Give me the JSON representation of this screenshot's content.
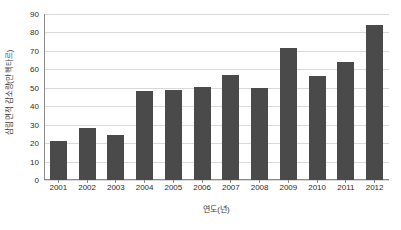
{
  "chart_data": {
    "type": "bar",
    "title": "",
    "subtitle": "",
    "xlabel": "연도(년)",
    "ylabel": "삼림 면적 감소량(만 헥타르)",
    "categories": [
      "2001",
      "2002",
      "2003",
      "2004",
      "2005",
      "2006",
      "2007",
      "2008",
      "2009",
      "2010",
      "2011",
      "2012"
    ],
    "values": [
      21,
      28,
      24.5,
      48,
      49,
      50.5,
      57,
      50,
      71.5,
      56.5,
      64,
      84
    ],
    "series": [
      {
        "name": "삼림 면적 감소량",
        "values": [
          21,
          28,
          24.5,
          48,
          49,
          50.5,
          57,
          50,
          71.5,
          56.5,
          64,
          84
        ]
      }
    ],
    "ylim": [
      0,
      90
    ],
    "yticks": [
      0,
      10,
      20,
      30,
      40,
      50,
      60,
      70,
      80,
      90
    ],
    "ytick_labels": [
      "0",
      "10",
      "20",
      "30",
      "40",
      "50",
      "60",
      "70",
      "80",
      "90"
    ],
    "grid": true,
    "grid_axis": "y",
    "legend": false,
    "legend_position": "none",
    "bar_color": "#4a4a4a",
    "grid_color": "#d9d9d9",
    "axis_color": "#8a8a8a",
    "background_color": "#ffffff",
    "text_color": "#2b2b2b"
  }
}
